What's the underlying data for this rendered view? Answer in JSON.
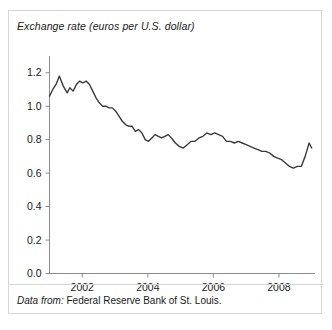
{
  "figure": {
    "title": "Exchange rate (euros per U.S. dollar)",
    "source_prefix": "Data from:",
    "source_text": "Federal Reserve Bank of St. Louis.",
    "line_color": "#3b3b3b",
    "axis_color": "#8c8c8c",
    "border_color": "#d6d6d6"
  },
  "chart_data": {
    "type": "line",
    "title": "Exchange rate (euros per U.S. dollar)",
    "xlabel": "",
    "ylabel": "Exchange rate (euros per U.S. dollar)",
    "xlim": [
      2001.0,
      2009.1
    ],
    "ylim": [
      0.0,
      1.3
    ],
    "grid": false,
    "legend": null,
    "xticks": [
      2002,
      2004,
      2006,
      2008
    ],
    "xtick_labels": [
      "2002",
      "2004",
      "2006",
      "2008"
    ],
    "yticks": [
      0.0,
      0.2,
      0.4,
      0.6,
      0.8,
      1.0,
      1.2
    ],
    "ytick_labels": [
      "0.0",
      "0.2",
      "0.4",
      "0.6",
      "0.8",
      "1.0",
      "1.2"
    ],
    "series": [
      {
        "name": "Euros per U.S. dollar",
        "x": [
          2001.0,
          2001.1,
          2001.2,
          2001.3,
          2001.42,
          2001.54,
          2001.62,
          2001.72,
          2001.82,
          2001.92,
          2002.02,
          2002.12,
          2002.22,
          2002.32,
          2002.42,
          2002.52,
          2002.62,
          2002.72,
          2002.82,
          2002.92,
          2003.02,
          2003.12,
          2003.22,
          2003.32,
          2003.42,
          2003.52,
          2003.62,
          2003.72,
          2003.82,
          2003.92,
          2004.02,
          2004.12,
          2004.22,
          2004.32,
          2004.42,
          2004.52,
          2004.62,
          2004.72,
          2004.84,
          2004.96,
          2005.08,
          2005.2,
          2005.32,
          2005.44,
          2005.56,
          2005.68,
          2005.8,
          2005.92,
          2006.04,
          2006.16,
          2006.28,
          2006.4,
          2006.52,
          2006.64,
          2006.76,
          2006.88,
          2007.0,
          2007.12,
          2007.24,
          2007.36,
          2007.48,
          2007.6,
          2007.72,
          2007.84,
          2007.96,
          2008.08,
          2008.2,
          2008.32,
          2008.44,
          2008.56,
          2008.68,
          2008.8,
          2008.92,
          2009.0
        ],
        "y": [
          1.06,
          1.1,
          1.13,
          1.18,
          1.12,
          1.08,
          1.11,
          1.09,
          1.13,
          1.15,
          1.14,
          1.15,
          1.13,
          1.09,
          1.05,
          1.02,
          1.0,
          1.0,
          0.99,
          0.99,
          0.97,
          0.94,
          0.91,
          0.89,
          0.88,
          0.88,
          0.85,
          0.86,
          0.84,
          0.8,
          0.79,
          0.81,
          0.83,
          0.82,
          0.81,
          0.82,
          0.83,
          0.81,
          0.78,
          0.76,
          0.75,
          0.77,
          0.79,
          0.79,
          0.81,
          0.82,
          0.84,
          0.83,
          0.84,
          0.83,
          0.82,
          0.79,
          0.79,
          0.78,
          0.79,
          0.78,
          0.77,
          0.76,
          0.75,
          0.74,
          0.73,
          0.73,
          0.72,
          0.7,
          0.69,
          0.68,
          0.66,
          0.64,
          0.63,
          0.64,
          0.64,
          0.7,
          0.78,
          0.75
        ]
      }
    ]
  }
}
